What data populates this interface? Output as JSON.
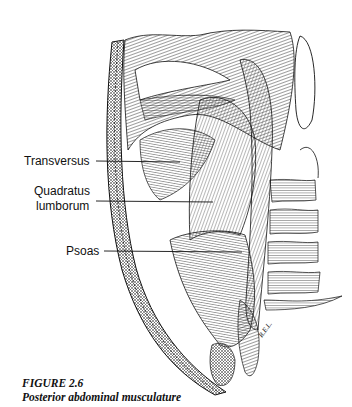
{
  "figure": {
    "number": "FIGURE 2.6",
    "caption": "Posterior abdominal musculature",
    "signature": "R.E.L.",
    "labels": [
      {
        "text": "Transversus"
      },
      {
        "text": "Quadratus"
      },
      {
        "text": "lumborum"
      },
      {
        "text": "Psoas"
      }
    ]
  }
}
